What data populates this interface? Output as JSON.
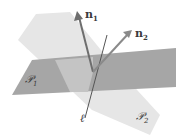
{
  "diagram": {
    "labels": {
      "n1": {
        "base": "n",
        "sub": "1"
      },
      "n2": {
        "base": "n",
        "sub": "2"
      },
      "p1": {
        "base": "𝒫",
        "sub": "1"
      },
      "p2": {
        "base": "𝒫",
        "sub": "2"
      },
      "line": "ℓ"
    },
    "colors": {
      "plane1": "#a6a6a6",
      "plane2": "#e6e6e6",
      "vector": "#6e6e6e",
      "line": "#555555",
      "text": "#3a3a3a"
    }
  }
}
